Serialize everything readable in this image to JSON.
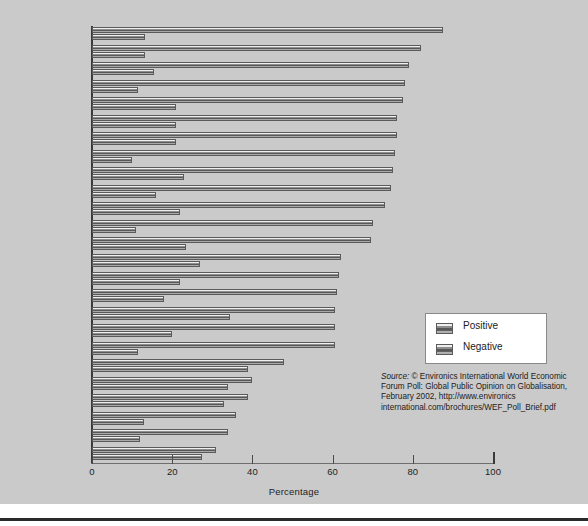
{
  "chart_data": {
    "type": "bar",
    "orientation": "horizontal",
    "title": "",
    "xlabel": "Percentage",
    "ylabel": "Country",
    "xlim": [
      0,
      100
    ],
    "xticks": [
      0,
      20,
      40,
      60,
      80,
      100
    ],
    "xtick_labels": [
      "0",
      "20",
      "40",
      "60",
      "80",
      "100"
    ],
    "grid": false,
    "legend_position": "center-right",
    "categories": [
      "Netherlands",
      "Venezuela",
      "India",
      "Qatar",
      "Germany",
      "United States",
      "Korea, Rep.",
      "China",
      "Canada",
      "Indonesia",
      "Great Britain",
      "Nigeria",
      "Mexico",
      "Brazil",
      "Italy",
      "South Africa",
      "Australia",
      "Chile",
      "Kazakhstan",
      "Argentina",
      "France",
      "Spain",
      "Russia",
      "Japan",
      "Turkey"
    ],
    "series": [
      {
        "name": "Positive",
        "color": "#6b6b6b",
        "values": [
          87.5,
          82,
          79,
          78,
          77.5,
          76,
          76,
          75.5,
          75,
          74.5,
          73,
          70,
          69.5,
          62,
          61.5,
          61,
          60.5,
          60.5,
          60.5,
          48,
          40,
          39,
          36,
          34,
          31
        ]
      },
      {
        "name": "Negative",
        "color": "#6b6b6b",
        "values": [
          13.3,
          13.3,
          15.5,
          11.5,
          21,
          21,
          21,
          10,
          23,
          16,
          22,
          11,
          23.5,
          27,
          22,
          18,
          34.5,
          20,
          11.5,
          39,
          34,
          33,
          13,
          12,
          27.5
        ]
      }
    ]
  },
  "legend": {
    "entries": [
      {
        "label": "Positive",
        "swatch": "positive-swatch"
      },
      {
        "label": "Negative",
        "swatch": "negative-swatch"
      }
    ]
  },
  "source": {
    "prefix": "Source:",
    "body": " © Environics International World Economic Forum Poll: Global Public Opinion on Globalisation, February 2002, http://www.environics international.com/brochures/WEF_Poll_Brief.pdf"
  }
}
